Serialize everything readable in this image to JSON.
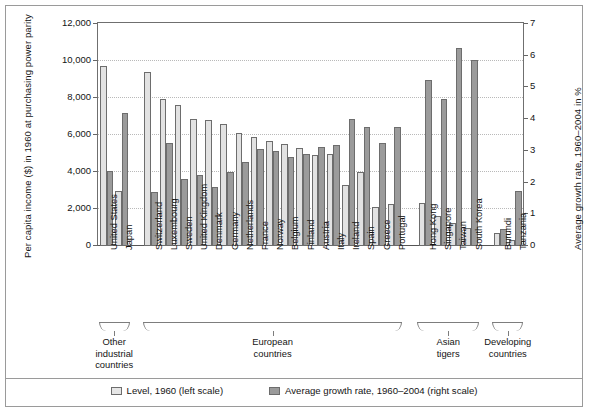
{
  "chart_data": {
    "type": "bar",
    "title": "",
    "subtitle": "",
    "xlabel": "",
    "ylabel": "Per capita income ($) in 1960 at purchasing power parity",
    "y2label": "Average growth rate, 1960–2004 in %",
    "ylim": [
      0,
      12000
    ],
    "y2lim": [
      0,
      7
    ],
    "yticks": [
      "0",
      "2,000",
      "4,000",
      "6,000",
      "8,000",
      "10,000",
      "12,000"
    ],
    "ytick_values": [
      0,
      2000,
      4000,
      6000,
      8000,
      10000,
      12000
    ],
    "y2ticks": [
      "0",
      "1",
      "2",
      "3",
      "4",
      "5",
      "6",
      "7"
    ],
    "y2tick_values": [
      0,
      1,
      2,
      3,
      4,
      5,
      6,
      7
    ],
    "grid": true,
    "legend_position": "bottom",
    "categories": [
      "United States",
      "Japan",
      "Switzerland",
      "Luxembourg",
      "Sweden",
      "United Kingdom",
      "Denmark",
      "Germany",
      "Netherlands",
      "France",
      "Norway",
      "Belgium",
      "Finland",
      "Austria",
      "Italy",
      "Ireland",
      "Spain",
      "Greece",
      "Portugal",
      "Hong Kong",
      "Singapore",
      "Taiwan",
      "South Korea",
      "Burundi",
      "Tanzania"
    ],
    "series": [
      {
        "name": "Level, 1960 (left scale)",
        "axis": "left",
        "color": "#e2e2e2",
        "values": [
          9750,
          2950,
          9420,
          7920,
          7620,
          6840,
          6800,
          6620,
          6100,
          5900,
          5680,
          5540,
          5320,
          4900,
          5000,
          3320,
          4000,
          2120,
          2250,
          2300,
          1630,
          1250,
          950,
          680,
          320
        ]
      },
      {
        "name": "Average growth rate, 1960–2004 (right scale)",
        "axis": "right",
        "color": "#9b9b9b",
        "values": [
          2.35,
          4.2,
          1.7,
          3.25,
          2.1,
          2.25,
          1.85,
          2.33,
          2.65,
          3.05,
          3.0,
          2.82,
          2.9,
          3.12,
          3.2,
          4.0,
          3.75,
          3.25,
          3.75,
          5.25,
          4.62,
          6.25,
          5.85,
          0.55,
          1.75
        ]
      }
    ],
    "groups": [
      {
        "label": "Other\nindustrial\ncountries",
        "start": 0,
        "end": 1
      },
      {
        "label": "European\ncountries",
        "start": 2,
        "end": 18
      },
      {
        "label": "Asian\ntigers",
        "start": 19,
        "end": 22
      },
      {
        "label": "Developing\ncountries",
        "start": 23,
        "end": 24
      }
    ]
  },
  "legend": {
    "items": [
      {
        "label": "Level, 1960 (left scale)",
        "style": "level"
      },
      {
        "label": "Average growth rate, 1960–2004 (right scale)",
        "style": "growth"
      }
    ]
  },
  "groups_text": {
    "other_industrial": {
      "line1": "Other",
      "line2": "industrial",
      "line3": "countries"
    },
    "european": {
      "line1": "European",
      "line2": "countries",
      "line3": ""
    },
    "asian": {
      "line1": "Asian",
      "line2": "tigers",
      "line3": ""
    },
    "developing": {
      "line1": "Developing",
      "line2": "countries",
      "line3": ""
    }
  },
  "colors": {
    "level_fill": "#e2e2e2",
    "growth_fill": "#9b9b9b",
    "bar_border": "#6d6d6d",
    "grid": "#b9b9b9",
    "frame": "#9a9a9a",
    "text": "#141414"
  }
}
